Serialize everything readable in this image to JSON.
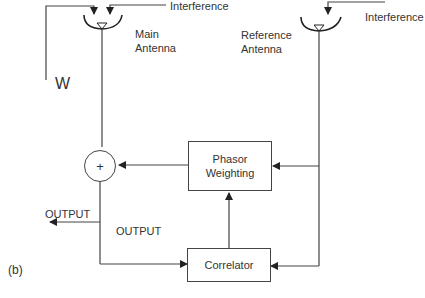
{
  "diagram": {
    "panel_label": "(b)",
    "nodes": {
      "main_antenna": {
        "label_line1": "Main",
        "label_line2": "Antenna"
      },
      "reference_antenna": {
        "label_line1": "Reference",
        "label_line2": "Antenna"
      },
      "summer": {
        "symbol": "+"
      },
      "phasor_weighting": {
        "label_line1": "Phasor",
        "label_line2": "Weighting"
      },
      "correlator": {
        "label": "Correlator"
      }
    },
    "signals": {
      "interference_main": "Interference",
      "interference_reference": "Interference",
      "desired_signal": "W",
      "output_arrow": "OUTPUT",
      "output_mid": "OUTPUT"
    },
    "edges": [
      {
        "from": "interference_main",
        "to": "main_antenna"
      },
      {
        "from": "desired_signal",
        "to": "main_antenna"
      },
      {
        "from": "interference_reference",
        "to": "reference_antenna"
      },
      {
        "from": "main_antenna",
        "to": "summer"
      },
      {
        "from": "reference_antenna",
        "to": "phasor_weighting"
      },
      {
        "from": "reference_antenna",
        "to": "correlator"
      },
      {
        "from": "phasor_weighting",
        "to": "summer"
      },
      {
        "from": "correlator",
        "to": "phasor_weighting"
      },
      {
        "from": "summer",
        "to": "output"
      },
      {
        "from": "summer",
        "to": "correlator"
      }
    ],
    "colors": {
      "line": "#444444",
      "text": "#333333",
      "background": "#ffffff"
    }
  }
}
